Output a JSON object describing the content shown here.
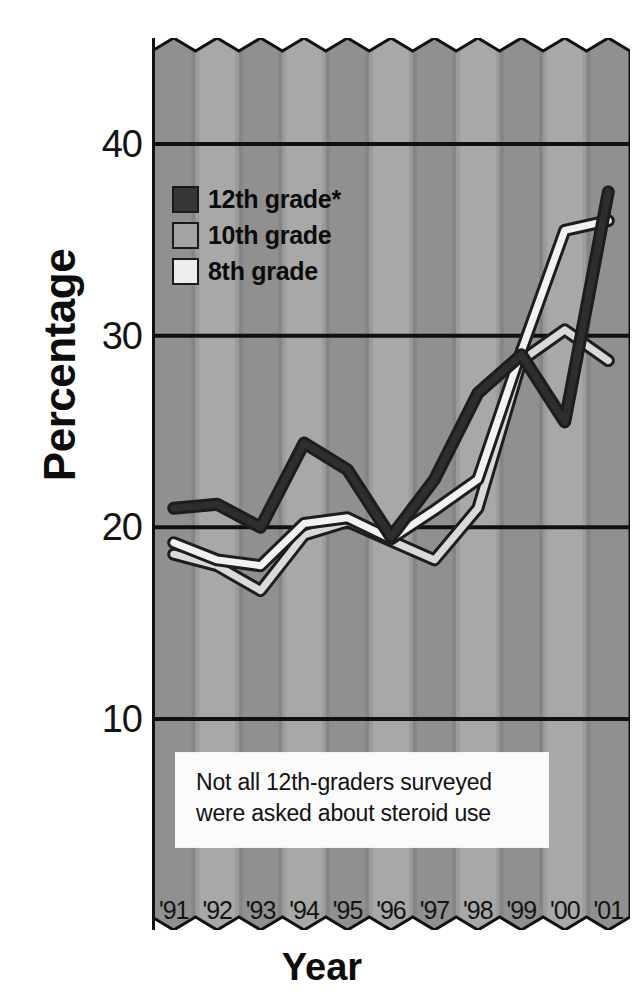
{
  "chart_data": {
    "type": "line",
    "title": "",
    "xlabel": "Year",
    "ylabel": "Percentage",
    "categories": [
      "'91",
      "'92",
      "'93",
      "'94",
      "'95",
      "'96",
      "'97",
      "'98",
      "'99",
      "'00",
      "'01"
    ],
    "x": [
      1991,
      1992,
      1993,
      1994,
      1995,
      1996,
      1997,
      1998,
      1999,
      2000,
      2001
    ],
    "ylim": [
      0,
      46
    ],
    "xlim": [
      1991,
      2001
    ],
    "yticks": [
      10,
      20,
      30,
      40
    ],
    "ytick_labels": [
      "10",
      "20",
      "30",
      "40"
    ],
    "grid": "horizontal",
    "legend_position": "upper-left",
    "series": [
      {
        "name": "12th grade*",
        "color": "#2e2e2e",
        "values": [
          21.0,
          21.2,
          20.0,
          24.4,
          23.0,
          19.5,
          22.5,
          27.0,
          29.0,
          25.5,
          37.5
        ]
      },
      {
        "name": "10th grade",
        "color": "#f2f2f2",
        "values": [
          19.2,
          18.3,
          18.0,
          20.2,
          20.5,
          19.4,
          20.9,
          22.5,
          29.2,
          35.5,
          36.0
        ]
      },
      {
        "name": "8th grade",
        "color": "#d9d9d9",
        "values": [
          18.6,
          18.0,
          16.7,
          19.6,
          20.3,
          19.3,
          18.3,
          21.0,
          28.7,
          30.3,
          28.7
        ]
      }
    ],
    "annotations": [
      {
        "name": "footnote-box",
        "lines": [
          "Not all 12th-graders surveyed",
          "were asked about steroid use"
        ]
      }
    ]
  },
  "axes": {
    "ylabel": "Percentage",
    "xlabel": "Year",
    "yticks": [
      "40",
      "30",
      "20",
      "10"
    ],
    "xticks": [
      "'91",
      "'92",
      "'93",
      "'94",
      "'95",
      "'96",
      "'97",
      "'98",
      "'99",
      "'00",
      "'01"
    ]
  },
  "legend": {
    "items": [
      {
        "label": "12th grade*",
        "swatch": "#373737"
      },
      {
        "label": "10th grade",
        "swatch": "#a3a3a3"
      },
      {
        "label": "8th grade",
        "swatch": "#ededed"
      }
    ]
  },
  "note": {
    "line1": "Not all 12th-graders surveyed",
    "line2": "were asked about steroid use"
  },
  "colors": {
    "background": "#ffffff",
    "band_dark": "#909090",
    "band_light": "#a8a8a8",
    "gridline": "#101010",
    "axis": "#101010",
    "series_12th": "#2e2e2e",
    "series_10th": "#f4f4f4",
    "series_8th": "#d6d6d6",
    "text": "#111111"
  }
}
